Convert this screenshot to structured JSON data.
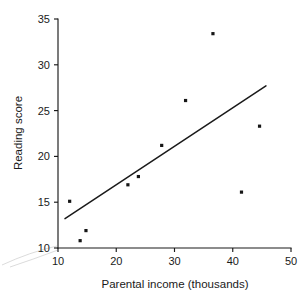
{
  "chart_data": {
    "type": "scatter",
    "title": "",
    "xlabel": "Parental income (thousands)",
    "ylabel": "Reading score",
    "xlim": [
      10,
      50
    ],
    "ylim": [
      10,
      35
    ],
    "xticks": [
      10,
      20,
      30,
      40,
      50
    ],
    "yticks": [
      10,
      15,
      20,
      25,
      30,
      35
    ],
    "xtick_labels": [
      "10",
      "20",
      "30",
      "40",
      "50"
    ],
    "ytick_labels": [
      "10",
      "15",
      "20",
      "25",
      "30",
      "35"
    ],
    "grid": false,
    "legend": null,
    "marker": "square",
    "marker_color": "#161616",
    "line_color": "#1a1a1a",
    "axis_color": "#1a1a1a",
    "points": [
      {
        "x": 12.0,
        "y": 15.1
      },
      {
        "x": 13.8,
        "y": 10.8
      },
      {
        "x": 14.8,
        "y": 11.9
      },
      {
        "x": 22.0,
        "y": 16.9
      },
      {
        "x": 23.8,
        "y": 17.8
      },
      {
        "x": 27.8,
        "y": 21.2
      },
      {
        "x": 31.9,
        "y": 26.1
      },
      {
        "x": 36.6,
        "y": 33.4
      },
      {
        "x": 41.5,
        "y": 16.1
      },
      {
        "x": 44.6,
        "y": 23.3
      }
    ],
    "series": [
      {
        "name": "observations",
        "x": [
          12.0,
          13.8,
          14.8,
          22.0,
          23.8,
          27.8,
          31.9,
          36.6,
          41.5,
          44.6
        ],
        "values": [
          15.1,
          10.8,
          11.9,
          16.9,
          17.8,
          21.2,
          26.1,
          33.4,
          16.1,
          23.3
        ]
      }
    ],
    "fit_line": {
      "name": "regression-line",
      "x_start": 11.2,
      "y_start": 13.2,
      "x_end": 45.7,
      "y_end": 27.7
    },
    "annotations": []
  },
  "axes": {
    "x_axis_label": "Parental income (thousands)",
    "y_axis_label": "Reading score"
  }
}
